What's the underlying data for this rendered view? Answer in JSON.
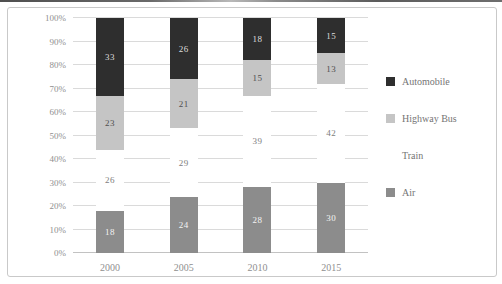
{
  "chart_data": {
    "type": "bar",
    "stacked": true,
    "percent": true,
    "title": "",
    "xlabel": "",
    "ylabel": "",
    "categories": [
      "2000",
      "2005",
      "2010",
      "2015"
    ],
    "series": [
      {
        "name": "Air",
        "color": "#8c8c8c",
        "label_color": "#f4f4f4",
        "values": [
          18,
          24,
          28,
          30
        ]
      },
      {
        "name": "Train",
        "color": "#ffffff",
        "label_color": "#7d7d7d",
        "values": [
          26,
          29,
          39,
          42
        ]
      },
      {
        "name": "Highway Bus",
        "color": "#c5c5c5",
        "label_color": "#4f4f4f",
        "values": [
          23,
          21,
          15,
          13
        ]
      },
      {
        "name": "Automobile",
        "color": "#2e2e2e",
        "label_color": "#dedede",
        "values": [
          33,
          26,
          18,
          15
        ]
      }
    ],
    "legend_order": [
      "Automobile",
      "Highway Bus",
      "Train",
      "Air"
    ],
    "legend_position": "right",
    "grid": true,
    "ylim": [
      0,
      100
    ],
    "y_ticks": [
      "0%",
      "10%",
      "20%",
      "30%",
      "40%",
      "50%",
      "60%",
      "70%",
      "80%",
      "90%",
      "100%"
    ]
  },
  "colors": {
    "background": "#ffffff",
    "frame_border": "#c9c9c9",
    "gridline": "#dadada",
    "axis_text": "#8f8f8f",
    "legend_text": "#757575",
    "top_rule": "#5c5c5c"
  }
}
